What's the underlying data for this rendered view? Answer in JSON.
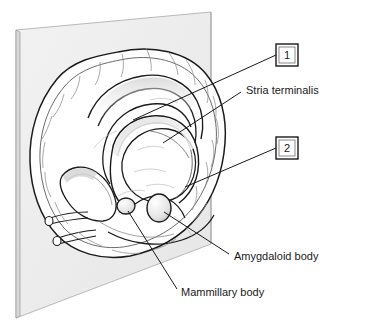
{
  "figure": {
    "background_color": "#ffffff",
    "ink_color": "#1a1a1a",
    "plane_fill": "#ededed",
    "plane_edge": "#9a9a9a",
    "brain_fill": "#ffffff",
    "shade_color": "#cfcfcf"
  },
  "callout_boxes": [
    {
      "id": "callout-box-1",
      "number": "1",
      "box": {
        "x": 276,
        "y": 44,
        "w": 22,
        "h": 22
      },
      "leader": {
        "x1": 276,
        "y1": 55,
        "x2": 133,
        "y2": 120
      }
    },
    {
      "id": "callout-box-2",
      "number": "2",
      "box": {
        "x": 276,
        "y": 137,
        "w": 22,
        "h": 22
      },
      "leader": {
        "x1": 276,
        "y1": 148,
        "x2": 185,
        "y2": 187
      }
    }
  ],
  "labels": [
    {
      "id": "label-stria-terminalis",
      "text": "Stria terminalis",
      "text_x": 246,
      "text_y": 91,
      "leader": {
        "x1": 241,
        "y1": 92,
        "x2": 163,
        "y2": 143
      }
    },
    {
      "id": "label-amygdaloid-body",
      "text": "Amygdaloid body",
      "text_x": 234,
      "text_y": 257,
      "leader": {
        "x1": 229,
        "y1": 254,
        "x2": 164,
        "y2": 212
      }
    },
    {
      "id": "label-mammillary-body",
      "text": "Mammillary body",
      "text_x": 181,
      "text_y": 293,
      "leader": {
        "x1": 177,
        "y1": 289,
        "x2": 128,
        "y2": 211
      }
    }
  ],
  "structures": [
    {
      "id": "structure-mammillary-body",
      "name": "Mammillary body",
      "cx": 126,
      "cy": 206,
      "rx": 9,
      "ry": 8
    },
    {
      "id": "structure-amygdaloid-body",
      "name": "Amygdaloid body",
      "cx": 159,
      "cy": 208,
      "rx": 12,
      "ry": 14
    }
  ]
}
